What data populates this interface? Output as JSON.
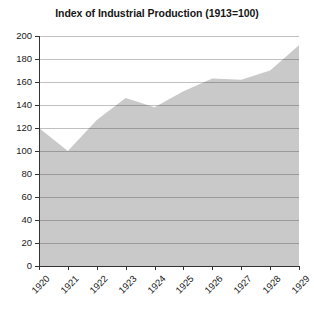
{
  "chart_data": {
    "type": "area",
    "title": "Index of Industrial Production (1913=100)",
    "xlabel": "",
    "ylabel": "",
    "categories": [
      "1920",
      "1921",
      "1922",
      "1923",
      "1924",
      "1925",
      "1926",
      "1927",
      "1928",
      "1929"
    ],
    "values": [
      120,
      100,
      127,
      146,
      138,
      152,
      163,
      162,
      170,
      192
    ],
    "series": [
      {
        "name": "Index of Industrial Production",
        "values": [
          120,
          100,
          127,
          146,
          138,
          152,
          163,
          162,
          170,
          192
        ]
      }
    ],
    "ylim": [
      0,
      200
    ],
    "yticks": [
      0,
      20,
      40,
      60,
      80,
      100,
      120,
      140,
      160,
      180,
      200
    ],
    "ytick_labels": [
      "0",
      "20",
      "40",
      "60",
      "80",
      "100",
      "120",
      "140",
      "160",
      "180",
      "200"
    ],
    "xtick_labels": [
      "1920",
      "1921",
      "1922",
      "1923",
      "1924",
      "1925",
      "1926",
      "1927",
      "1928",
      "1929"
    ],
    "grid": true,
    "legend": false,
    "legend_position": "none",
    "xtick_rotation": -45,
    "colors": {
      "area_fill": "#c9c9c9",
      "grid_line": "#9a9a9a",
      "axis_line": "#333333",
      "title_text": "#161616",
      "tick_text": "#1a1a1a",
      "background": "#ffffff"
    }
  }
}
